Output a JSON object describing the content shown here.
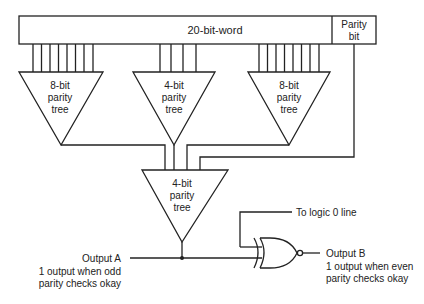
{
  "word_box": {
    "label": "20-bit-word"
  },
  "parity_box": {
    "line1": "Parity",
    "line2": "bit"
  },
  "trees": [
    {
      "line1": "8-bit",
      "line2": "parity",
      "line3": "tree"
    },
    {
      "line1": "4-bit",
      "line2": "parity",
      "line3": "tree"
    },
    {
      "line1": "8-bit",
      "line2": "parity",
      "line3": "tree"
    },
    {
      "line1": "4-bit",
      "line2": "parity",
      "line3": "tree"
    }
  ],
  "logic_line": {
    "label": "To logic 0 line"
  },
  "output_a": {
    "title": "Output A",
    "line1": "1 output when odd",
    "line2": "parity checks okay"
  },
  "output_b": {
    "title": "Output B",
    "line1": "1 output when even",
    "line2": "parity checks okay"
  },
  "gate": {
    "type": "XNOR"
  }
}
